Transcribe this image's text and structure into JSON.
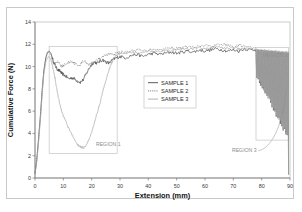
{
  "figure": {
    "background": "#ffffff",
    "frame_color": "#c9c9c9"
  },
  "chart_data": {
    "type": "line",
    "title": "",
    "xlabel": "Extension (mm)",
    "ylabel": "Cumulative Force (N)",
    "xlim": [
      0,
      90
    ],
    "ylim": [
      0,
      14
    ],
    "xticks": [
      0,
      10,
      20,
      30,
      40,
      50,
      60,
      70,
      80,
      90
    ],
    "yticks": [
      0,
      2,
      4,
      6,
      8,
      10,
      12,
      14
    ],
    "grid": false,
    "legend_position": "center",
    "series": [
      {
        "name": "SAMPLE 1",
        "color": "#4a4a4a",
        "style": "solid",
        "x": [
          0.0,
          0.6,
          1.2,
          1.9,
          2.5,
          3.1,
          3.8,
          4.4,
          5.0,
          5.6,
          6.2,
          6.9,
          7.5,
          8.1,
          8.8,
          9.4,
          10.0,
          11.0,
          12.0,
          13.0,
          14.0,
          15.0,
          16.0,
          17.0,
          18.0,
          19.0,
          20.0,
          21.0,
          22.0,
          23.0,
          24.0,
          25.0,
          26.0,
          27.0,
          28.0,
          29.0,
          30.0,
          32.0,
          34.0,
          36.0,
          38.0,
          40.0,
          42.0,
          44.0,
          46.0,
          48.0,
          50.0,
          52.0,
          54.0,
          56.0,
          58.0,
          60.0,
          62.0,
          64.0,
          66.0,
          68.0,
          70.0,
          72.0,
          74.0,
          76.0,
          78.0,
          79.0,
          80.0,
          81.0,
          82.0,
          83.0,
          84.0,
          85.0,
          86.0,
          87.0,
          88.0,
          88.5,
          89.0,
          89.4,
          89.8
        ],
        "y": [
          0.4,
          1.6,
          3.4,
          5.6,
          7.8,
          9.6,
          10.8,
          11.3,
          11.4,
          11.2,
          10.7,
          10.2,
          9.9,
          9.7,
          9.6,
          9.4,
          9.3,
          9.1,
          8.9,
          9.0,
          8.9,
          8.7,
          8.6,
          8.8,
          9.3,
          9.8,
          10.2,
          10.4,
          10.3,
          10.5,
          10.6,
          10.4,
          10.3,
          10.5,
          10.7,
          10.8,
          10.9,
          10.8,
          11.0,
          11.1,
          10.9,
          11.1,
          11.2,
          11.1,
          11.2,
          11.3,
          11.2,
          11.3,
          11.4,
          11.3,
          11.5,
          11.4,
          11.5,
          11.6,
          11.5,
          11.4,
          11.5,
          11.4,
          11.6,
          11.5,
          11.5,
          11.5,
          9.2,
          11.4,
          8.6,
          11.3,
          8.2,
          11.2,
          7.5,
          11.1,
          6.4,
          9.0,
          4.2,
          1.2,
          0.3
        ]
      },
      {
        "name": "SAMPLE 2",
        "color": "#6e6e6e",
        "style": "dotted",
        "x": [
          0.0,
          0.6,
          1.2,
          1.9,
          2.5,
          3.1,
          3.8,
          4.4,
          5.0,
          5.6,
          6.2,
          6.9,
          7.5,
          8.1,
          8.8,
          9.4,
          10.0,
          11.0,
          12.0,
          13.0,
          14.0,
          15.0,
          16.0,
          17.0,
          18.0,
          19.0,
          20.0,
          21.0,
          22.0,
          23.0,
          24.0,
          25.0,
          26.0,
          27.0,
          28.0,
          29.0,
          30.0,
          32.0,
          34.0,
          36.0,
          38.0,
          40.0,
          42.0,
          44.0,
          46.0,
          48.0,
          50.0,
          52.0,
          54.0,
          56.0,
          58.0,
          60.0,
          62.0,
          64.0,
          66.0,
          68.0,
          70.0,
          72.0,
          74.0,
          76.0,
          78.0,
          79.0,
          80.0,
          81.0,
          82.0,
          83.0,
          84.0,
          85.0,
          86.0,
          87.0,
          88.0,
          88.5,
          89.0,
          89.4,
          89.8
        ],
        "y": [
          0.4,
          1.5,
          3.2,
          5.4,
          7.6,
          9.5,
          10.7,
          11.2,
          11.3,
          11.1,
          10.5,
          10.2,
          10.3,
          10.4,
          10.2,
          10.0,
          10.1,
          10.2,
          10.4,
          10.5,
          10.3,
          10.1,
          10.2,
          10.5,
          10.4,
          10.2,
          10.3,
          10.5,
          10.6,
          10.8,
          10.9,
          11.0,
          11.1,
          11.2,
          11.1,
          11.2,
          11.3,
          11.3,
          11.4,
          11.5,
          11.4,
          11.5,
          11.6,
          11.5,
          11.6,
          11.7,
          11.6,
          11.7,
          11.8,
          11.7,
          11.8,
          11.9,
          11.8,
          11.9,
          12.0,
          11.9,
          11.8,
          11.9,
          11.8,
          11.7,
          11.6,
          11.6,
          9.5,
          11.5,
          8.9,
          11.4,
          8.4,
          11.3,
          7.8,
          11.2,
          6.8,
          9.4,
          4.6,
          1.5,
          0.3
        ]
      },
      {
        "name": "SAMPLE 3",
        "color": "#a8a8a8",
        "style": "solid",
        "x": [
          0.0,
          0.6,
          1.2,
          1.9,
          2.5,
          3.1,
          3.8,
          4.4,
          5.0,
          5.6,
          6.2,
          6.9,
          7.5,
          8.1,
          8.8,
          9.4,
          10.0,
          11.0,
          12.0,
          13.0,
          14.0,
          15.0,
          16.0,
          17.0,
          18.0,
          19.0,
          20.0,
          21.0,
          22.0,
          23.0,
          24.0,
          25.0,
          26.0,
          27.0,
          28.0,
          29.0,
          30.0,
          32.0,
          34.0,
          36.0,
          38.0,
          40.0,
          42.0,
          44.0,
          46.0,
          48.0,
          50.0,
          52.0,
          54.0,
          56.0,
          58.0,
          60.0,
          62.0,
          64.0,
          66.0,
          68.0,
          70.0,
          72.0,
          74.0,
          76.0,
          78.0,
          79.0,
          80.0,
          81.0,
          82.0,
          83.0,
          84.0,
          85.0,
          86.0,
          87.0,
          88.0,
          88.5,
          89.0,
          89.4,
          89.8
        ],
        "y": [
          0.4,
          1.4,
          3.0,
          5.2,
          7.4,
          9.3,
          10.4,
          10.8,
          10.9,
          10.6,
          10.0,
          9.2,
          8.3,
          7.4,
          6.6,
          6.0,
          5.6,
          5.0,
          4.4,
          3.9,
          3.4,
          3.0,
          2.8,
          2.7,
          2.9,
          3.4,
          4.1,
          5.0,
          5.9,
          6.8,
          7.8,
          8.8,
          9.6,
          10.3,
          10.8,
          11.1,
          11.2,
          11.2,
          11.3,
          11.2,
          11.3,
          11.4,
          11.3,
          11.4,
          11.5,
          11.4,
          11.5,
          11.6,
          11.5,
          11.6,
          11.7,
          11.6,
          11.7,
          11.8,
          11.7,
          11.6,
          11.7,
          11.6,
          11.7,
          11.6,
          11.5,
          11.5,
          9.8,
          11.4,
          9.1,
          11.3,
          8.6,
          11.2,
          8.0,
          11.1,
          7.0,
          9.6,
          5.0,
          1.8,
          0.3
        ]
      }
    ],
    "annotations": [
      {
        "label": "REGION 1",
        "box": {
          "x0": 5.0,
          "x1": 29.0,
          "y0": 2.2,
          "y1": 11.8
        },
        "label_x": 21.5,
        "label_y": 2.9
      },
      {
        "label": "REGION 2",
        "box": {
          "x0": 78.0,
          "x1": 89.5,
          "y0": 3.4,
          "y1": 11.7
        },
        "label_x": 80.5,
        "label_y": 10.9
      },
      {
        "label": "REGION 3",
        "label_x": 69.5,
        "label_y": 2.3
      }
    ]
  },
  "legend": {
    "items": [
      {
        "label": "SAMPLE 1"
      },
      {
        "label": "SAMPLE 2"
      },
      {
        "label": "SAMPLE 3"
      }
    ]
  }
}
